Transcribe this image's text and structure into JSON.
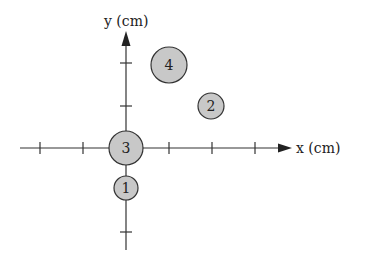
{
  "figure": {
    "axes": {
      "x_label": "x (cm)",
      "y_label": "y (cm)",
      "origin_px": [
        126,
        148
      ],
      "unit_px": 43,
      "x_ticks": [
        -2,
        -1,
        1,
        2,
        3
      ],
      "y_ticks": [
        -2,
        -1,
        1,
        2
      ]
    },
    "particles": [
      {
        "id": 1,
        "label": "1",
        "x": 0,
        "y": -1,
        "radius_px": 12
      },
      {
        "id": 2,
        "label": "2",
        "x": 2,
        "y": 1,
        "radius_px": 13
      },
      {
        "id": 3,
        "label": "3",
        "x": 0,
        "y": 0,
        "radius_px": 17
      },
      {
        "id": 4,
        "label": "4",
        "x": 1,
        "y": 2,
        "radius_px": 18
      }
    ],
    "colors": {
      "axis": "#333333",
      "particle_fill": "#c8c8c8",
      "particle_stroke": "#333333"
    }
  }
}
